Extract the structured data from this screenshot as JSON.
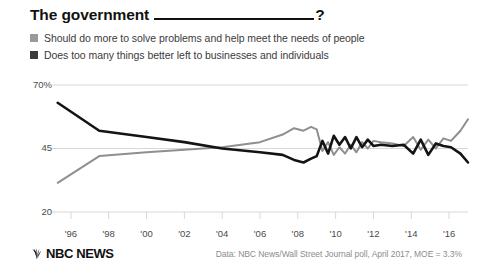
{
  "title": {
    "prefix": "The government",
    "blank": "________________________",
    "suffix": "?"
  },
  "legend": {
    "items": [
      {
        "label": "Should do more to solve problems and help meet the needs of people",
        "color": "#9a9a9a",
        "swatch_icon": "square-swatch"
      },
      {
        "label": "Does too many things better left to businesses and individuals",
        "color": "#3a3a3a",
        "swatch_icon": "square-swatch"
      }
    ]
  },
  "footer": {
    "brand": "NBC NEWS",
    "brand_icon": "nbc-peacock-icon",
    "source": "Data: NBC News/Wall Street Journal poll, April 2017, MOE = 3.3%"
  },
  "colors": {
    "series_more": "#8f8f8f",
    "series_too_much": "#141414",
    "gridline": "#d8d8d8",
    "axis_text": "#4a4a4a",
    "title_text": "#111111"
  },
  "chart_data": {
    "type": "line",
    "xlabel": "",
    "ylabel": "",
    "ylim": [
      20,
      70
    ],
    "yticks": [
      20,
      45,
      70
    ],
    "ytick_labels": [
      "20",
      "45",
      "70%"
    ],
    "xlim": [
      1995,
      2017
    ],
    "xticks": [
      1996,
      1998,
      2000,
      2002,
      2004,
      2006,
      2008,
      2010,
      2012,
      2014,
      2016
    ],
    "xtick_labels": [
      "'96",
      "'98",
      "'00",
      "'02",
      "'04",
      "'06",
      "'08",
      "'10",
      "'12",
      "'14",
      "'16"
    ],
    "grid": "horizontal",
    "legend_position": "above-plot",
    "series": [
      {
        "name": "Should do more to solve problems and help meet the needs of people",
        "color": "#8f8f8f",
        "points": [
          [
            1995.3,
            31.5
          ],
          [
            1997.5,
            42.0
          ],
          [
            2000.0,
            43.5
          ],
          [
            2002.0,
            44.5
          ],
          [
            2004.0,
            45.5
          ],
          [
            2006.0,
            47.5
          ],
          [
            2007.2,
            50.5
          ],
          [
            2007.8,
            53.0
          ],
          [
            2008.3,
            52.0
          ],
          [
            2008.7,
            53.5
          ],
          [
            2009.0,
            52.5
          ],
          [
            2009.3,
            44.0
          ],
          [
            2009.6,
            47.5
          ],
          [
            2009.9,
            42.5
          ],
          [
            2010.2,
            45.5
          ],
          [
            2010.5,
            43.0
          ],
          [
            2010.8,
            46.5
          ],
          [
            2011.1,
            43.5
          ],
          [
            2011.4,
            47.5
          ],
          [
            2011.7,
            45.0
          ],
          [
            2012.0,
            48.0
          ],
          [
            2012.4,
            47.5
          ],
          [
            2013.0,
            47.0
          ],
          [
            2013.6,
            46.0
          ],
          [
            2014.1,
            49.5
          ],
          [
            2014.5,
            44.5
          ],
          [
            2014.9,
            48.5
          ],
          [
            2015.3,
            45.0
          ],
          [
            2015.7,
            49.0
          ],
          [
            2016.1,
            48.0
          ],
          [
            2016.6,
            52.0
          ],
          [
            2017.0,
            56.5
          ]
        ]
      },
      {
        "name": "Does too many things better left to businesses and individuals",
        "color": "#141414",
        "points": [
          [
            1995.3,
            63.0
          ],
          [
            1997.5,
            52.0
          ],
          [
            2000.0,
            49.5
          ],
          [
            2002.0,
            47.5
          ],
          [
            2004.0,
            45.0
          ],
          [
            2006.0,
            43.5
          ],
          [
            2007.2,
            42.5
          ],
          [
            2007.8,
            40.5
          ],
          [
            2008.3,
            39.5
          ],
          [
            2008.7,
            41.0
          ],
          [
            2009.0,
            42.0
          ],
          [
            2009.3,
            48.0
          ],
          [
            2009.6,
            43.0
          ],
          [
            2009.9,
            50.0
          ],
          [
            2010.2,
            46.5
          ],
          [
            2010.5,
            49.5
          ],
          [
            2010.8,
            45.0
          ],
          [
            2011.1,
            49.5
          ],
          [
            2011.4,
            45.5
          ],
          [
            2011.7,
            48.5
          ],
          [
            2012.0,
            46.0
          ],
          [
            2012.4,
            46.5
          ],
          [
            2013.0,
            46.0
          ],
          [
            2013.6,
            46.5
          ],
          [
            2014.1,
            43.0
          ],
          [
            2014.5,
            48.5
          ],
          [
            2014.9,
            42.5
          ],
          [
            2015.3,
            47.0
          ],
          [
            2015.7,
            46.0
          ],
          [
            2016.1,
            45.5
          ],
          [
            2016.6,
            43.0
          ],
          [
            2017.0,
            39.5
          ]
        ]
      }
    ]
  }
}
